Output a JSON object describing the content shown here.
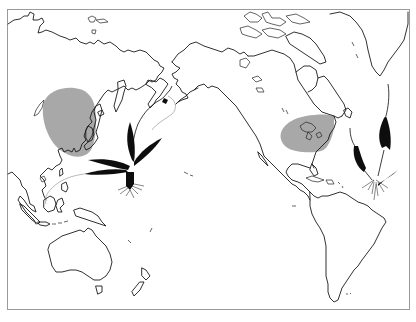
{
  "map": {
    "type": "world-map-pacific-centered",
    "projection": "Pacific-centered equirectangular-like",
    "frame_color": "#9a9a9a",
    "coastline_color": "#1a1a1a",
    "background_color": "#ffffff",
    "distribution_regions": [
      {
        "name": "East Asia range",
        "region": "Eastern China, Korea, Japan",
        "fill": "#a8a8a8"
      },
      {
        "name": "Eastern North America range",
        "region": "Great Lakes and eastern United States",
        "fill": "#a8a8a8"
      }
    ],
    "illustrations": [
      {
        "name": "Asian plant specimen",
        "location": "Western Pacific, near Philippines",
        "style": "black silhouette with roots"
      },
      {
        "name": "American plant specimen",
        "location": "Western Atlantic, east of Caribbean",
        "style": "black silhouette with roots"
      }
    ],
    "landmasses": [
      "Asia",
      "Australia",
      "New Zealand",
      "North America",
      "Greenland",
      "South America",
      "Indonesia",
      "Japan",
      "Alaska",
      "Canadian Arctic Archipelago",
      "Caribbean Islands"
    ]
  }
}
